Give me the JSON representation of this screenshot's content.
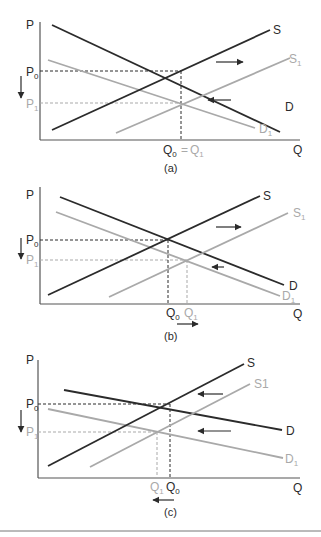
{
  "colors": {
    "dark": "#2b2b2b",
    "light": "#a9a9a9",
    "axis": "#555555",
    "rule": "#777777"
  },
  "panels": [
    {
      "caption": "(a)",
      "axis": {
        "y": "P",
        "x": "Q"
      },
      "curves": {
        "S": "S",
        "S1": "S",
        "S1_sub": "1",
        "D": "D",
        "D1": "D",
        "D1_sub": "1"
      },
      "price": {
        "p0": "P",
        "p0_sub": "0",
        "p1": "P",
        "p1_sub": "1"
      },
      "quantity": {
        "q0": "Q",
        "q0_sub": "0",
        "eq": "=",
        "q1": "Q",
        "q1_sub": "1"
      }
    },
    {
      "caption": "(b)",
      "axis": {
        "y": "P",
        "x": "Q"
      },
      "curves": {
        "S": "S",
        "S1": "S",
        "S1_sub": "1",
        "D": "D",
        "D1": "D",
        "D1_sub": "1"
      },
      "price": {
        "p0": "P",
        "p0_sub": "0",
        "p1": "P",
        "p1_sub": "1"
      },
      "quantity": {
        "q0": "Q",
        "q0_sub": "0",
        "q1": "Q",
        "q1_sub": "1"
      }
    },
    {
      "caption": "(c)",
      "axis": {
        "y": "P",
        "x": "Q"
      },
      "curves": {
        "S": "S",
        "S1": "S1",
        "D": "D",
        "D1": "D",
        "D1_sub": "1"
      },
      "price": {
        "p0": "P",
        "p0_sub": "0",
        "p1": "P",
        "p1_sub": "1"
      },
      "quantity": {
        "q0": "Q",
        "q0_sub": "0",
        "q1": "Q",
        "q1_sub": "1"
      }
    }
  ]
}
